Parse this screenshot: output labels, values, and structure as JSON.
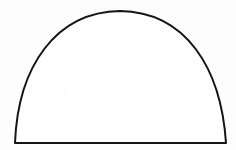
{
  "canvas": {
    "width": 236,
    "height": 150,
    "background_color": "#fdfdfd"
  },
  "figure": {
    "name": "arch-outline",
    "description": "Hand-drawn closed arch outline, parabola-like dome on a straight horizontal base",
    "stroke_color": "#141414",
    "fill_color": "#ffffff",
    "stroke_width": 2,
    "geometry": {
      "base_left": [
        15,
        143
      ],
      "base_right": [
        226,
        143
      ],
      "apex": [
        120,
        11
      ],
      "baseline_y": 143,
      "left_control": [
        18,
        40
      ],
      "right_control": [
        222,
        40
      ],
      "path": "M 15 143 C 18 66 56 12 120 11 C 186 12 221 68 226 143 Z"
    }
  }
}
